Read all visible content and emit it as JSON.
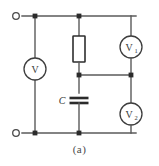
{
  "figure": {
    "caption": "(a)",
    "type": "electrical-schematic"
  },
  "components": {
    "voltmeter_main": {
      "symbol": "V",
      "subscript": "",
      "name": "voltmeter-v"
    },
    "voltmeter_1": {
      "symbol": "V",
      "subscript": "1",
      "name": "voltmeter-v1"
    },
    "voltmeter_2": {
      "symbol": "V",
      "subscript": "2",
      "name": "voltmeter-v2"
    },
    "resistor": {
      "label": "",
      "name": "resistor"
    },
    "capacitor": {
      "label": "C",
      "name": "capacitor"
    }
  },
  "terminals": {
    "top": "",
    "bottom": ""
  },
  "colors": {
    "wire": "#5a5a5a",
    "wire_dark": "#3a3a3a",
    "node": "#2b2b2b",
    "component_outline": "#2e2e2e",
    "background": "#ffffff",
    "text": "#3a3a3a"
  }
}
